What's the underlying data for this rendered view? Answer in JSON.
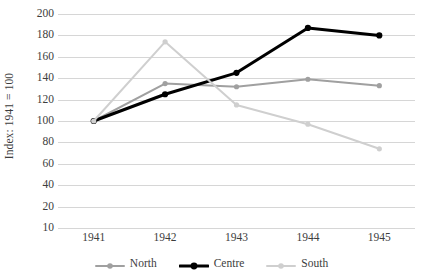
{
  "chart_data": {
    "type": "line",
    "title": "",
    "subtitle": "",
    "xlabel": "",
    "ylabel": "Index: 1941 = 100",
    "categories": [
      "1941",
      "1942",
      "1943",
      "1944",
      "1945"
    ],
    "x": [
      1941,
      1942,
      1943,
      1944,
      1945
    ],
    "series": [
      {
        "name": "North",
        "color": "#a0a0a0",
        "values": [
          100,
          135,
          132,
          139,
          133
        ],
        "line_width": 2,
        "marker": "circle"
      },
      {
        "name": "Centre",
        "color": "#000000",
        "values": [
          100,
          125,
          145,
          187,
          180
        ],
        "line_width": 3,
        "marker": "circle"
      },
      {
        "name": "South",
        "color": "#cfcfcf",
        "values": [
          100,
          174,
          115,
          97,
          74
        ],
        "line_width": 2,
        "marker": "circle"
      }
    ],
    "ylim": [
      10,
      200
    ],
    "yticks": [
      200,
      180,
      160,
      140,
      120,
      100,
      80,
      60,
      40,
      20,
      10
    ],
    "ytick_labels": [
      "200",
      "180",
      "160",
      "140",
      "120",
      "100",
      "80",
      "60",
      "40",
      "20",
      "10"
    ],
    "grid": true,
    "grid_axis": "y",
    "grid_color": "#d6d6d6",
    "legend": true,
    "legend_position": "bottom",
    "background": "#ffffff",
    "axis_text_color": "#3d3d3d"
  },
  "legend": {
    "entries": [
      {
        "label": "North",
        "icon": "line-marker-icon"
      },
      {
        "label": "Centre",
        "icon": "line-marker-icon"
      },
      {
        "label": "South",
        "icon": "line-marker-icon"
      }
    ]
  }
}
